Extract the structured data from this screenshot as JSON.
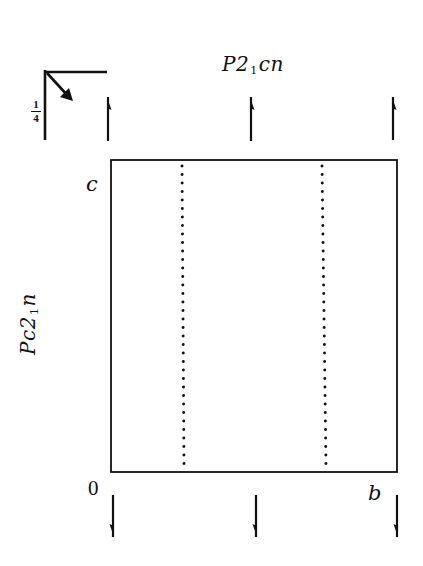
{
  "diagram": {
    "type": "space-group symmetry diagram (projection)",
    "labels": {
      "top_symbol": {
        "main": "P2",
        "sub": "1",
        "rest": "cn"
      },
      "side_symbol": {
        "main": "Pc2",
        "sub": "1",
        "rest": "n"
      },
      "axis_c": "c",
      "origin": "0",
      "axis_b": "b",
      "height_fraction": {
        "numerator": "1",
        "denominator": "4"
      }
    },
    "cell": {
      "x": 111,
      "y": 160,
      "width": 286,
      "height": 312,
      "stroke": "#111111"
    },
    "glide_planes_dotted": [
      {
        "x_top": 182,
        "x_bottom": 184,
        "y_top": 166,
        "y_bottom": 467
      },
      {
        "x_top": 322,
        "x_bottom": 326,
        "y_top": 166,
        "y_bottom": 467
      }
    ],
    "screw_axes_top": [
      {
        "x": 108,
        "y_tail": 141,
        "y_head": 97,
        "direction": "up"
      },
      {
        "x": 251,
        "y_tail": 141,
        "y_head": 97,
        "direction": "up"
      },
      {
        "x": 393,
        "y_tail": 140,
        "y_head": 97,
        "direction": "up"
      }
    ],
    "screw_axes_bottom": [
      {
        "x": 113,
        "y_tail": 495,
        "y_head": 537,
        "direction": "down"
      },
      {
        "x": 256,
        "y_tail": 495,
        "y_head": 537,
        "direction": "down"
      },
      {
        "x": 397,
        "y_tail": 495,
        "y_head": 537,
        "direction": "down"
      }
    ],
    "corner_symbol": {
      "vertical": {
        "x": 45,
        "y1": 70,
        "y2": 140
      },
      "horizontal": {
        "y": 72,
        "x1": 45,
        "x2": 107
      },
      "diagonal_arrow": {
        "x1": 47,
        "y1": 73,
        "x2": 73,
        "y2": 101
      }
    },
    "colors": {
      "ink": "#111111",
      "background": "#ffffff"
    }
  }
}
